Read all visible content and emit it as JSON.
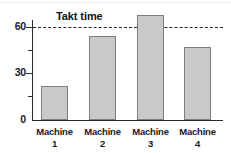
{
  "chart_data": {
    "type": "bar",
    "title": "",
    "subtitle": "",
    "xlabel": "",
    "ylabel": "",
    "categories": [
      "Machine 1",
      "Machine 2",
      "Machine 3",
      "Machine 4"
    ],
    "category_lines": [
      {
        "line1": "Machine",
        "line2": "1"
      },
      {
        "line1": "Machine",
        "line2": "2"
      },
      {
        "line1": "Machine",
        "line2": "3"
      },
      {
        "line1": "Machine",
        "line2": "4"
      }
    ],
    "values": [
      22,
      54,
      68,
      47
    ],
    "ylim": [
      0,
      75
    ],
    "yticks": [
      0,
      30,
      60
    ],
    "ytick_labels": [
      "0",
      "30",
      "60"
    ],
    "yminor_ticks": [
      15,
      45
    ],
    "grid": false,
    "legend_position": "none",
    "annotations": [
      {
        "name": "takt-time",
        "label": "Takt time",
        "value": 60,
        "style": "dashed-horizontal-line"
      }
    ],
    "colors": {
      "bar_fill": "#c9c9c9",
      "bar_border": "#7d7d7d",
      "axis": "#2b2b2b",
      "takt_line": "#222222",
      "text": "#1a1a1a",
      "background": "#ffffff"
    }
  }
}
